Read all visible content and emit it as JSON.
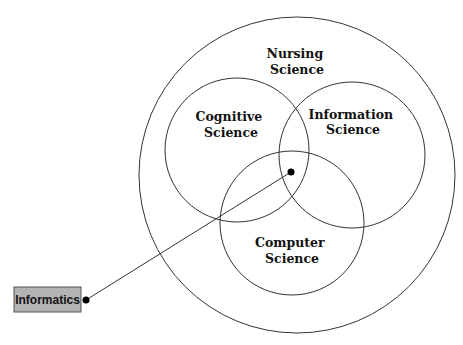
{
  "diagram": {
    "type": "venn",
    "outer": {
      "label_lines": [
        "Nursing",
        "Science"
      ]
    },
    "sets": [
      {
        "name": "cognitive-science",
        "label_lines": [
          "Cognitive",
          "Science"
        ]
      },
      {
        "name": "information-science",
        "label_lines": [
          "Information",
          "Science"
        ]
      },
      {
        "name": "computer-science",
        "label_lines": [
          "Computer",
          "Science"
        ]
      }
    ],
    "callout": {
      "label": "Informatics",
      "points_to": "intersection of Cognitive, Information and Computer Science within Nursing Science"
    }
  }
}
